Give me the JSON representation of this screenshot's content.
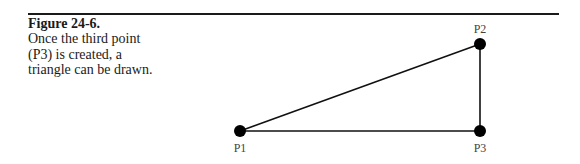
{
  "caption": {
    "figure_number": "Figure 24-6.",
    "text": "Once the third point (P3) is created, a triangle can be drawn."
  },
  "diagram": {
    "points": [
      {
        "id": "P1",
        "label": "P1",
        "x": 240,
        "y": 131
      },
      {
        "id": "P2",
        "label": "P2",
        "x": 480,
        "y": 44
      },
      {
        "id": "P3",
        "label": "P3",
        "x": 480,
        "y": 131
      }
    ],
    "edges": [
      [
        "P1",
        "P2"
      ],
      [
        "P2",
        "P3"
      ],
      [
        "P1",
        "P3"
      ]
    ],
    "colors": {
      "line": "#111111",
      "point": "#000000",
      "label": "#444444"
    }
  }
}
